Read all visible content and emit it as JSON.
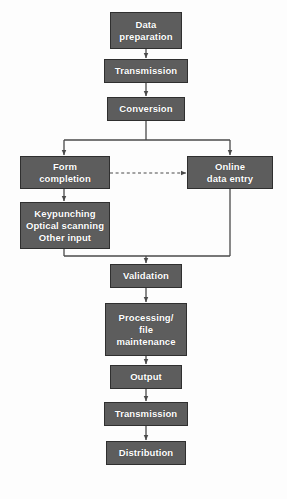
{
  "diagram": {
    "background_color": "#fdfdfd",
    "node_fill_color": "#5d5d5d",
    "node_border_color": "#2f2f2f",
    "node_text_color": "#ffffff",
    "edge_color": "#4a4a4a"
  },
  "nodes": {
    "data_preparation": {
      "label": "Data preparation",
      "line1": "Data",
      "line2": "preparation"
    },
    "transmission_top": {
      "label": "Transmission",
      "line1": "Transmission"
    },
    "conversion": {
      "label": "Conversion",
      "line1": "Conversion"
    },
    "form_completion": {
      "label": "Form completion",
      "line1": "Form",
      "line2": "completion"
    },
    "online_data_entry": {
      "label": "Online data entry",
      "line1": "Online",
      "line2": "data entry"
    },
    "input_methods": {
      "label": "Keypunching Optical scanning Other input",
      "line1": "Keypunching",
      "line2": "Optical scanning",
      "line3": "Other input"
    },
    "validation": {
      "label": "Validation",
      "line1": "Validation"
    },
    "processing": {
      "label": "Processing/ file maintenance",
      "line1": "Processing/",
      "line2": "file",
      "line3": "maintenance"
    },
    "output": {
      "label": "Output",
      "line1": "Output"
    },
    "transmission_bottom": {
      "label": "Transmission",
      "line1": "Transmission"
    },
    "distribution": {
      "label": "Distribution",
      "line1": "Distribution"
    }
  },
  "edges": [
    {
      "name": "data-preparation-to-transmission",
      "from": "data_preparation",
      "to": "transmission_top",
      "style": "solid",
      "arrow": true
    },
    {
      "name": "transmission-to-conversion",
      "from": "transmission_top",
      "to": "conversion",
      "style": "solid",
      "arrow": true
    },
    {
      "name": "conversion-to-form-completion",
      "from": "conversion",
      "to": "form_completion",
      "style": "solid",
      "arrow": true
    },
    {
      "name": "conversion-to-online-data-entry",
      "from": "conversion",
      "to": "online_data_entry",
      "style": "solid",
      "arrow": true
    },
    {
      "name": "form-completion-to-online-data-entry",
      "from": "form_completion",
      "to": "online_data_entry",
      "style": "dashed",
      "arrow": true
    },
    {
      "name": "form-completion-to-input-methods",
      "from": "form_completion",
      "to": "input_methods",
      "style": "solid",
      "arrow": true
    },
    {
      "name": "input-methods-to-validation",
      "from": "input_methods",
      "to": "validation",
      "style": "solid",
      "arrow": true
    },
    {
      "name": "online-data-entry-to-validation",
      "from": "online_data_entry",
      "to": "validation",
      "style": "solid",
      "arrow": true
    },
    {
      "name": "validation-to-processing",
      "from": "validation",
      "to": "processing",
      "style": "solid",
      "arrow": true
    },
    {
      "name": "processing-to-output",
      "from": "processing",
      "to": "output",
      "style": "solid",
      "arrow": true
    },
    {
      "name": "output-to-transmission",
      "from": "output",
      "to": "transmission_bottom",
      "style": "solid",
      "arrow": true
    },
    {
      "name": "transmission-to-distribution",
      "from": "transmission_bottom",
      "to": "distribution",
      "style": "solid",
      "arrow": true
    }
  ]
}
